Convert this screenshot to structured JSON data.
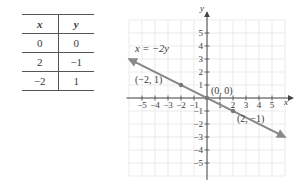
{
  "table": {
    "headers": [
      "x",
      "y"
    ],
    "rows": [
      [
        "0",
        "0"
      ],
      [
        "2",
        "−1"
      ],
      [
        "−2",
        "1"
      ]
    ]
  },
  "chart_data": {
    "type": "line",
    "title": "",
    "equation": "x = −2y",
    "xlabel": "x",
    "ylabel": "y",
    "xlim": [
      -6,
      6
    ],
    "ylim": [
      -6,
      6
    ],
    "x_ticks": [
      "−5",
      "−4",
      "−3",
      "−2",
      "−1",
      "1",
      "2",
      "3",
      "4",
      "5"
    ],
    "y_ticks": [
      "5",
      "4",
      "3",
      "2",
      "1",
      "−1",
      "−2",
      "−3",
      "−4",
      "−5"
    ],
    "grid": true,
    "series": [
      {
        "name": "x = −2y",
        "x": [
          -6,
          6
        ],
        "y": [
          3,
          -3
        ]
      }
    ],
    "points": [
      {
        "x": -2,
        "y": 1,
        "label": "(−2, 1)"
      },
      {
        "x": 0,
        "y": 0,
        "label": "(0, 0)"
      },
      {
        "x": 2,
        "y": -1,
        "label": "(2, −1)"
      }
    ]
  }
}
